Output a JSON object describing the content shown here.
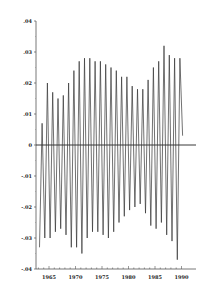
{
  "chart_data": {
    "type": "line",
    "title": "",
    "xlabel": "",
    "ylabel": "",
    "xlim": [
      1962.7,
      1990.5
    ],
    "ylim": [
      -0.04,
      0.04
    ],
    "x_ticks": [
      "1965",
      "1970",
      "1975",
      "1980",
      "1985",
      "1990"
    ],
    "y_ticks": [
      ".04",
      ".03",
      ".02",
      ".01",
      "0",
      "-.01",
      "-.02",
      "-.03",
      "-.04"
    ],
    "y_tick_values": [
      0.04,
      0.03,
      0.02,
      0.01,
      0,
      -0.01,
      -0.02,
      -0.03,
      -0.04
    ],
    "zero_line": true,
    "grid": false,
    "legend": null,
    "series": [
      {
        "name": "seasonal component",
        "x": [
          1963.2,
          1963.7,
          1964.2,
          1964.7,
          1965.2,
          1965.7,
          1966.2,
          1966.7,
          1967.2,
          1967.7,
          1968.2,
          1968.7,
          1969.2,
          1969.7,
          1970.2,
          1970.7,
          1971.2,
          1971.7,
          1972.2,
          1972.7,
          1973.2,
          1973.7,
          1974.2,
          1974.7,
          1975.2,
          1975.7,
          1976.2,
          1976.7,
          1977.2,
          1977.7,
          1978.2,
          1978.7,
          1979.2,
          1979.7,
          1980.2,
          1980.7,
          1981.2,
          1981.7,
          1982.2,
          1982.7,
          1983.2,
          1983.7,
          1984.2,
          1984.7,
          1985.2,
          1985.7,
          1986.2,
          1986.7,
          1987.2,
          1987.7,
          1988.2,
          1988.7,
          1989.2,
          1989.7,
          1990.2
        ],
        "values": [
          -0.033,
          0.007,
          -0.03,
          0.02,
          -0.03,
          0.017,
          -0.028,
          0.015,
          -0.027,
          0.016,
          -0.029,
          0.02,
          -0.033,
          0.024,
          -0.033,
          0.027,
          -0.035,
          0.028,
          -0.03,
          0.028,
          -0.028,
          0.027,
          -0.028,
          0.027,
          -0.029,
          0.026,
          -0.03,
          0.025,
          -0.028,
          0.024,
          -0.025,
          0.022,
          -0.023,
          0.022,
          -0.021,
          0.019,
          -0.02,
          0.018,
          -0.019,
          0.018,
          -0.022,
          0.021,
          -0.026,
          0.025,
          -0.027,
          0.027,
          -0.025,
          0.032,
          -0.029,
          0.029,
          -0.031,
          0.028,
          -0.037,
          0.028,
          0.003
        ]
      }
    ]
  }
}
